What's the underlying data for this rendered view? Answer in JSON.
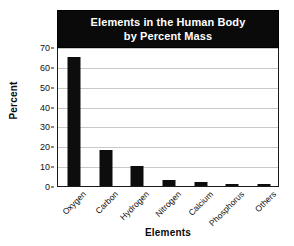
{
  "chart_data": {
    "type": "bar",
    "title": "Elements in the Human Body by Percent Mass",
    "title_lines": [
      "Elements in the Human Body",
      "by Percent Mass"
    ],
    "categories": [
      "Oxygen",
      "Carbon",
      "Hydrogen",
      "Nitrogen",
      "Calcium",
      "Phosphorus",
      "Others"
    ],
    "values": [
      65,
      18,
      10,
      3,
      2,
      1,
      1
    ],
    "xlabel": "Elements",
    "ylabel": "Percent",
    "ylim": [
      0,
      70
    ],
    "ytick_values": [
      0,
      10,
      20,
      30,
      40,
      50,
      60,
      70
    ],
    "ytick_labels": [
      "0",
      "10",
      "20",
      "30",
      "40",
      "50",
      "60",
      "70"
    ],
    "grid": true,
    "grid_axis": "y",
    "legend": false,
    "bar_color": "#0d0d0d",
    "title_background": "#0a0a0a",
    "title_color": "#ffffff",
    "gridline_color": "#c9c9c9",
    "axis_color": "#1a1a1a",
    "xtick_rotation": -45
  }
}
